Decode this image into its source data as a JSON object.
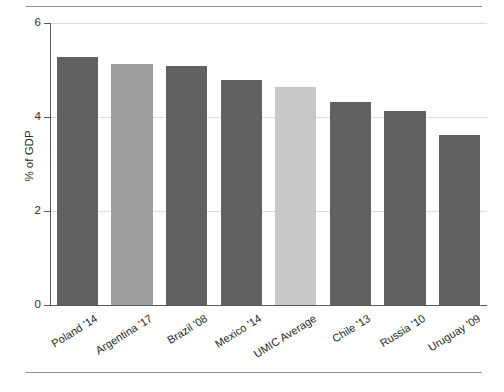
{
  "chart_data": {
    "type": "bar",
    "title": "",
    "xlabel": "",
    "ylabel": "% of GDP",
    "ylim": [
      0,
      6
    ],
    "yticks": [
      0,
      2,
      4,
      6
    ],
    "ytick_labels": [
      "0",
      "2",
      "4",
      "6"
    ],
    "grid": true,
    "legend": "none",
    "categories": [
      "Poland '14",
      "Argentina '17",
      "Brazil '08",
      "Mexico '14",
      "UMIC Average",
      "Chile '13",
      "Russia '10",
      "Uruguay '09"
    ],
    "values": [
      5.28,
      5.13,
      5.08,
      4.78,
      4.63,
      4.31,
      4.13,
      3.62
    ],
    "bar_colors": [
      "#616161",
      "#9e9e9e",
      "#616161",
      "#616161",
      "#c8c8c8",
      "#616161",
      "#616161",
      "#616161"
    ]
  },
  "colors": {
    "bar_dark": "#616161",
    "bar_medium": "#9e9e9e",
    "bar_light": "#c8c8c8",
    "axis": "#5a5a5a",
    "grid": "#dcdcdc",
    "rule": "#8e8e8e",
    "text": "#1f1f1f",
    "background": "#ffffff"
  }
}
